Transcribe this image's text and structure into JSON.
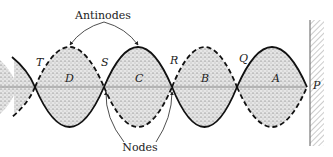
{
  "figure": {
    "type": "standing-wave-diagram",
    "annotations": {
      "antinodes_label": "Antinodes",
      "nodes_label": "Nodes"
    },
    "node_labels": [
      "T",
      "S",
      "R",
      "Q",
      "P"
    ],
    "loop_labels": [
      "D",
      "C",
      "B",
      "A"
    ],
    "colors": {
      "stroke": "#111111",
      "fill_stipple": "#d8d8d8",
      "axis": "#888888",
      "wall": "#777777"
    }
  }
}
